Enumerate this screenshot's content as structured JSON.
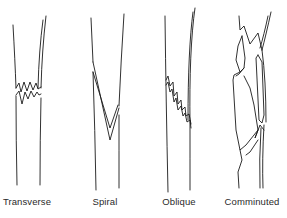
{
  "figure": {
    "title": "",
    "background": "#ffffff",
    "stroke_color": "#1a1a1a",
    "fractures": [
      {
        "id": "transverse",
        "label": "Transverse",
        "label_x": 27
      },
      {
        "id": "spiral",
        "label": "Spiral",
        "label_x": 105
      },
      {
        "id": "oblique",
        "label": "Oblique",
        "label_x": 179
      },
      {
        "id": "comminuted",
        "label": "Comminuted",
        "label_x": 252
      }
    ]
  }
}
